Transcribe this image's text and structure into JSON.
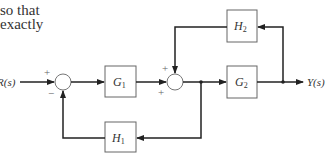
{
  "text_fragment": {
    "lines": [
      "so that",
      "exactly"
    ]
  },
  "diagram": {
    "input_label": "R(s)",
    "output_label": "Y(s)",
    "blocks": {
      "G1": {
        "name": "G",
        "sub": "1"
      },
      "G2": {
        "name": "G",
        "sub": "2"
      },
      "H1": {
        "name": "H",
        "sub": "1"
      },
      "H2": {
        "name": "H",
        "sub": "2"
      }
    },
    "junction1": {
      "signs": {
        "input": "+",
        "feedback": "−"
      }
    },
    "junction2": {
      "signs": {
        "top": "+",
        "left": "+"
      }
    },
    "colors": {
      "line": "#333333",
      "junction": "#777777"
    }
  }
}
